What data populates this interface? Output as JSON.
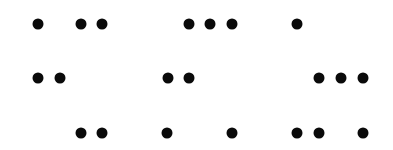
{
  "figure": {
    "type": "dot-pattern",
    "background": "#ffffff",
    "dot_color": "#0a0a0a",
    "dot_diameter": 11,
    "rows": [
      {
        "y": 24,
        "dots_x": [
          38,
          81,
          102,
          189,
          210,
          232,
          297
        ]
      },
      {
        "y": 78,
        "dots_x": [
          38,
          60,
          168,
          189,
          319,
          341,
          363
        ]
      },
      {
        "y": 133,
        "dots_x": [
          81,
          102,
          167,
          232,
          297,
          319,
          363
        ]
      }
    ]
  }
}
